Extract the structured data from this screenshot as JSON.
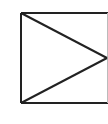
{
  "diagram": {
    "shape": "rectangle-with-triangle",
    "stroke_color": "#222222",
    "background": "#ffffff",
    "rect": {
      "x": 21,
      "y": 13,
      "right": 108,
      "bottom": 103
    },
    "triangle": {
      "points": [
        [
          21,
          13
        ],
        [
          107,
          58
        ],
        [
          21,
          103
        ]
      ]
    }
  }
}
